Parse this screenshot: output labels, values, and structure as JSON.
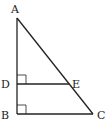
{
  "diagram": {
    "type": "geometry-triangle",
    "points": {
      "A": {
        "label": "A",
        "x": 17,
        "y": 18
      },
      "B": {
        "label": "B",
        "x": 17,
        "y": 114
      },
      "C": {
        "label": "C",
        "x": 93,
        "y": 114
      },
      "D": {
        "label": "D",
        "x": 17,
        "y": 84
      },
      "E": {
        "label": "E",
        "x": 69,
        "y": 84
      }
    },
    "segments": [
      "AB",
      "BC",
      "AC",
      "DE"
    ],
    "right_angles": [
      "D",
      "B"
    ],
    "stroke_color": "#222222"
  }
}
